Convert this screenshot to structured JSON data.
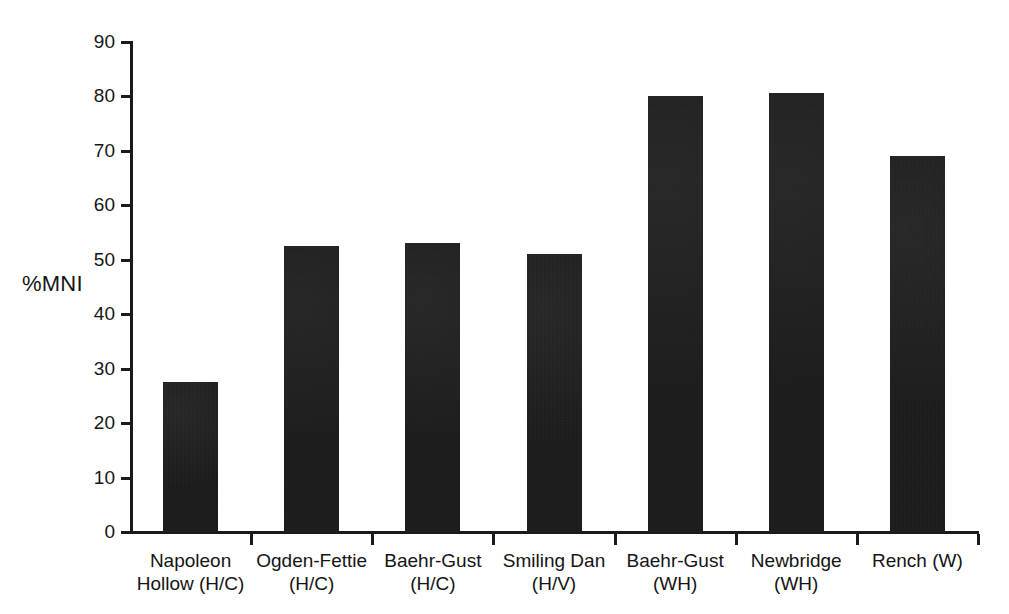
{
  "chart_data": {
    "type": "bar",
    "title": "",
    "subtitle": "",
    "xlabel": "",
    "ylabel": "%MNI",
    "ylim": [
      0,
      90
    ],
    "yticks": [
      0,
      10,
      20,
      30,
      40,
      50,
      60,
      70,
      80,
      90
    ],
    "ytick_labels": [
      "0",
      "10",
      "20",
      "30",
      "40",
      "50",
      "60",
      "70",
      "80",
      "90"
    ],
    "grid": false,
    "legend": null,
    "bar_color": "#151515",
    "background_color": "#ffffff",
    "axis_color": "#1a1a1a",
    "categories": [
      "Napoleon\nHollow (H/C)",
      "Ogden-Fettie\n(H/C)",
      "Baehr-Gust\n(H/C)",
      "Smiling Dan\n(H/V)",
      "Baehr-Gust\n(WH)",
      "Newbridge\n(WH)",
      "Rench (W)"
    ],
    "values": [
      27.5,
      52.6,
      53.0,
      51.0,
      80.0,
      80.6,
      69.0
    ]
  }
}
